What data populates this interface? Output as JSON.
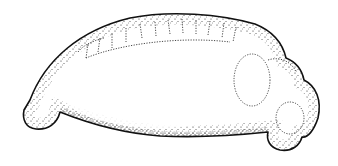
{
  "figure": {
    "background_color": "#ffffff",
    "ink_color": "#111111",
    "parts": [
      "tail",
      "dorsal-somites",
      "yolk-body",
      "optic-vesicle",
      "head"
    ]
  }
}
